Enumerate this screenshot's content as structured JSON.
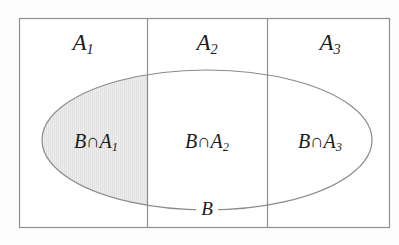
{
  "figure": {
    "background_color": "#fdfdfd",
    "line_color": "#8c8c8c",
    "text_color": "#1b1b1b",
    "shade_color": "#e9e9e9"
  },
  "partitions": [
    {
      "id": "A1",
      "base": "A",
      "subscript": "1",
      "label": "A₁"
    },
    {
      "id": "A2",
      "base": "A",
      "subscript": "2",
      "label": "A₂"
    },
    {
      "id": "A3",
      "base": "A",
      "subscript": "3",
      "label": "A₃"
    }
  ],
  "event": {
    "id": "B",
    "label": "B"
  },
  "intersections": [
    {
      "id": "BA1",
      "base": "B∩A",
      "subscript": "1",
      "label": "B∩A₁",
      "shaded": "true"
    },
    {
      "id": "BA2",
      "base": "B∩A",
      "subscript": "2",
      "label": "B∩A₂",
      "shaded": "false"
    },
    {
      "id": "BA3",
      "base": "B∩A",
      "subscript": "3",
      "label": "B∩A₃",
      "shaded": "false"
    }
  ],
  "symbols": {
    "intersection": "∩",
    "set_letter": "A",
    "event_letter": "B"
  },
  "geometry": {
    "rect": {
      "x": 19,
      "y": 18,
      "width": 371,
      "height": 210
    },
    "dividers_x": [
      147,
      267
    ],
    "ellipse": {
      "cx": 207,
      "cy": 140,
      "rx": 165,
      "ry": 70
    }
  }
}
